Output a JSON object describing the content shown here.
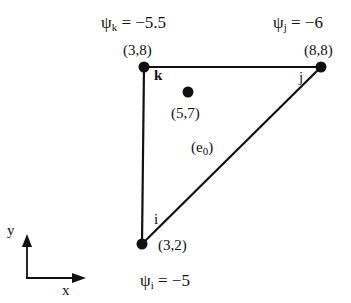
{
  "nodes": {
    "k": {
      "label": "k",
      "coord": "(3,8)",
      "psi_symbol": "ψ",
      "psi_sub": "k",
      "psi_value": "= −5.5"
    },
    "j": {
      "label": "j",
      "coord": "(8,8)",
      "psi_symbol": "ψ",
      "psi_sub": "j",
      "psi_value": "= −6"
    },
    "i": {
      "label": "i",
      "coord": "(3,2)",
      "psi_symbol": "ψ",
      "psi_sub": "i",
      "psi_value": "= −5"
    }
  },
  "interior_point": {
    "coord": "(5,7)"
  },
  "element": {
    "label_open": "(e",
    "label_sub": "0",
    "label_close": ")"
  },
  "axes": {
    "x_label": "x",
    "y_label": "y"
  },
  "colors": {
    "ink": "#111111",
    "background": "#ffffff"
  }
}
